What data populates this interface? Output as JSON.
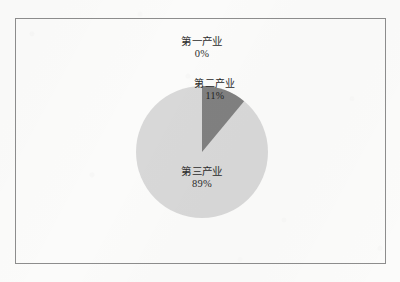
{
  "figure": {
    "background_color": "#fbfbfa",
    "frame_color": "#8d8d8d"
  },
  "chart_data": {
    "type": "pie",
    "title": "",
    "subtitle": "",
    "xlabel": "",
    "ylabel": "",
    "grid": false,
    "legend": "none",
    "labels_inside": true,
    "start_angle_deg": 0,
    "direction": "clockwise",
    "center_px": [
      202,
      152
    ],
    "radius_px": 66,
    "categories": [
      "第一产业",
      "第二产业",
      "第三产业"
    ],
    "values": [
      0,
      11,
      89
    ],
    "value_labels": [
      "0%",
      "11%",
      "89%"
    ],
    "colors": [
      "#d8d8d8",
      "#808080",
      "#d8d8d8"
    ],
    "slices": [
      {
        "name": "第一产业",
        "value": 0,
        "value_label": "0%",
        "color": "#d8d8d8",
        "start_deg": 0,
        "end_deg": 0,
        "label_text": "第一产业",
        "label_position": "outside-top"
      },
      {
        "name": "第二产业",
        "value": 11,
        "value_label": "11%",
        "color": "#808080",
        "start_deg": 0,
        "end_deg": 39.6,
        "label_text": "第二产业",
        "label_position": "inside"
      },
      {
        "name": "第三产业",
        "value": 89,
        "value_label": "89%",
        "color": "#d8d8d8",
        "start_deg": 39.6,
        "end_deg": 360,
        "label_text": "第三产业",
        "label_position": "inside"
      }
    ]
  }
}
